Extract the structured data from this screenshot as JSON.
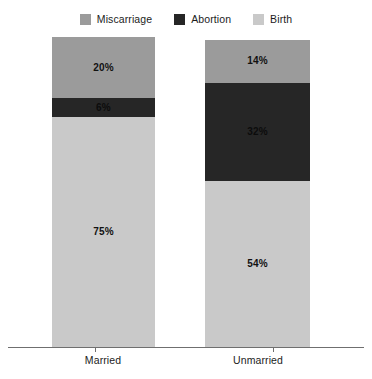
{
  "chart_data": {
    "type": "bar",
    "subtype": "stacked-bar-100",
    "title": "",
    "subtitle": "",
    "xlabel": "",
    "ylabel": "",
    "categories": [
      "Married",
      "Unmarried"
    ],
    "series": [
      {
        "name": "Miscarriage",
        "values": [
          20,
          14
        ],
        "color": "#9b9b9b"
      },
      {
        "name": "Abortion",
        "values": [
          6,
          32
        ],
        "color": "#262626"
      },
      {
        "name": "Birth",
        "values": [
          75,
          54
        ],
        "color": "#c9c9c9"
      }
    ],
    "value_labels": [
      [
        "20%",
        "6%",
        "75%"
      ],
      [
        "14%",
        "32%",
        "54%"
      ]
    ],
    "ylim": [
      0,
      100
    ],
    "grid": false,
    "legend_position": "top",
    "axis_color": "#6f6f6f",
    "background": "#ffffff"
  },
  "legend": {
    "items": [
      {
        "label": "Miscarriage",
        "swatch_name": "legend-swatch-miscarriage",
        "color": "#9b9b9b"
      },
      {
        "label": "Abortion",
        "swatch_name": "legend-swatch-abortion",
        "color": "#262626"
      },
      {
        "label": "Birth",
        "swatch_name": "legend-swatch-birth",
        "color": "#c9c9c9"
      }
    ]
  },
  "axis": {
    "categories": [
      {
        "label": "Married"
      },
      {
        "label": "Unmarried"
      }
    ]
  },
  "bars": [
    {
      "category": "Married",
      "segments": [
        {
          "series": "Miscarriage",
          "value": 20,
          "label": "20%",
          "color": "#9b9b9b",
          "label_tone": "on-light"
        },
        {
          "series": "Abortion",
          "value": 6,
          "label": "6%",
          "color": "#262626",
          "label_tone": "on-dark"
        },
        {
          "series": "Birth",
          "value": 75,
          "label": "75%",
          "color": "#c9c9c9",
          "label_tone": "on-light"
        }
      ]
    },
    {
      "category": "Unmarried",
      "segments": [
        {
          "series": "Miscarriage",
          "value": 14,
          "label": "14%",
          "color": "#9b9b9b",
          "label_tone": "on-light"
        },
        {
          "series": "Abortion",
          "value": 32,
          "label": "32%",
          "color": "#262626",
          "label_tone": "on-dark"
        },
        {
          "series": "Birth",
          "value": 54,
          "label": "54%",
          "color": "#c9c9c9",
          "label_tone": "on-light"
        }
      ]
    }
  ],
  "geometry": {
    "bars": [
      {
        "left": 52,
        "width": 103,
        "top": 37,
        "bottom": 347,
        "tick_x": 95,
        "label_center": 103,
        "label_top": 355
      },
      {
        "left": 205,
        "width": 105,
        "top": 40,
        "bottom": 347,
        "tick_x": 273,
        "label_center": 258,
        "label_top": 355
      }
    ],
    "axis_line": {
      "left": 8,
      "right": 364,
      "y": 347
    }
  }
}
